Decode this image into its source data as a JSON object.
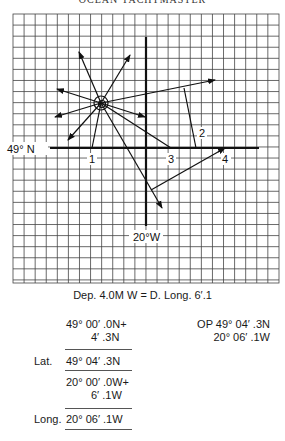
{
  "header": {
    "title": "OCEAN YACHTMASTER"
  },
  "diagram": {
    "grid": {
      "x0": 13,
      "y0": 14,
      "x1": 279,
      "y1": 283,
      "cell": 11.08
    },
    "axis_lat_label": "49° N",
    "axis_long_label": "20°W",
    "points": [
      {
        "id": "1",
        "label": "1"
      },
      {
        "id": "2",
        "label": "2"
      },
      {
        "id": "3",
        "label": "3"
      },
      {
        "id": "4",
        "label": "4"
      }
    ]
  },
  "caption": "Dep. 4.0M W =  D. Long. 6′.1",
  "calculation": {
    "lat_rows": [
      "49° 00′ .0N+",
      "4′ .3N"
    ],
    "lat_label": "Lat.",
    "lat_result": "49° 04′ .3N",
    "long_rows": [
      "20° 00′ .0W+",
      "6′ .1W"
    ],
    "long_label": "Long.",
    "long_result": "20° 06′ .1W"
  },
  "observed_position": {
    "line1": "OP 49° 04′ .3N",
    "line2": "20° 06′ .1W"
  }
}
